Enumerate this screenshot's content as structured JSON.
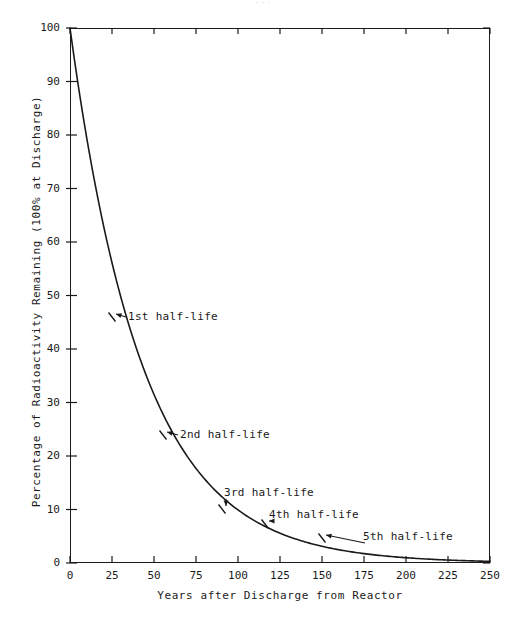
{
  "figure": {
    "page_artifact": "···",
    "background_color": "#ffffff",
    "line_color": "#1a1a1a"
  },
  "chart_data": {
    "type": "line",
    "title": "",
    "xlabel": "Years after Discharge from Reactor",
    "ylabel": "Percentage of Radioactivity Remaining (100% at Discharge)",
    "xlim": [
      0,
      250
    ],
    "ylim": [
      0,
      100
    ],
    "grid": false,
    "legend": "none",
    "xticks": [
      0,
      25,
      50,
      75,
      100,
      125,
      150,
      175,
      200,
      225,
      250
    ],
    "xtick_labels": [
      "0",
      "25",
      "50",
      "75",
      "100",
      "125",
      "150",
      "175",
      "200",
      "225",
      "250"
    ],
    "yticks": [
      0,
      10,
      20,
      30,
      40,
      50,
      60,
      70,
      80,
      90,
      100
    ],
    "ytick_labels": [
      "0",
      "10",
      "20",
      "30",
      "40",
      "50",
      "60",
      "70",
      "80",
      "90",
      "100"
    ],
    "series": [
      {
        "name": "Radioactivity remaining",
        "x": [
          0,
          2,
          4,
          6,
          8,
          10,
          13,
          16,
          20,
          25,
          30,
          35,
          40,
          45,
          50,
          55,
          60,
          70,
          80,
          95,
          110,
          125,
          140,
          155,
          170,
          185,
          200,
          215,
          230,
          250
        ],
        "y": [
          100,
          95.5,
          89.7,
          84.1,
          79.0,
          74.6,
          69.0,
          64.0,
          58.2,
          53.0,
          50.0,
          44.5,
          40.6,
          37.0,
          33.8,
          25.0,
          26.9,
          22.3,
          18.6,
          12.5,
          9.2,
          6.25,
          4.6,
          3.1,
          2.3,
          1.7,
          1.2,
          0.85,
          0.6,
          0.35
        ]
      }
    ],
    "annotations": [
      {
        "label": "1st half-life",
        "x": 25,
        "y": 50,
        "text_px": [
          128,
          311
        ],
        "point_px": [
          112,
          317
        ],
        "arrow": "left"
      },
      {
        "label": "2nd half-life",
        "x": 55,
        "y": 25,
        "text_px": [
          180,
          429
        ],
        "point_px": [
          163,
          435
        ],
        "arrow": "left"
      },
      {
        "label": "3rd half-life",
        "x": 95,
        "y": 12.5,
        "text_px": [
          224,
          487
        ],
        "point_px": [
          222,
          509
        ],
        "arrow": "down-left"
      },
      {
        "label": "4th half-life",
        "x": 125,
        "y": 6.25,
        "text_px": [
          269,
          509
        ],
        "point_px": [
          265,
          524
        ],
        "arrow": "down-left"
      },
      {
        "label": "5th half-life",
        "x": 155,
        "y": 3.1,
        "text_px": [
          363,
          531
        ],
        "point_px": [
          322,
          538
        ],
        "arrow": "down-left"
      }
    ]
  }
}
